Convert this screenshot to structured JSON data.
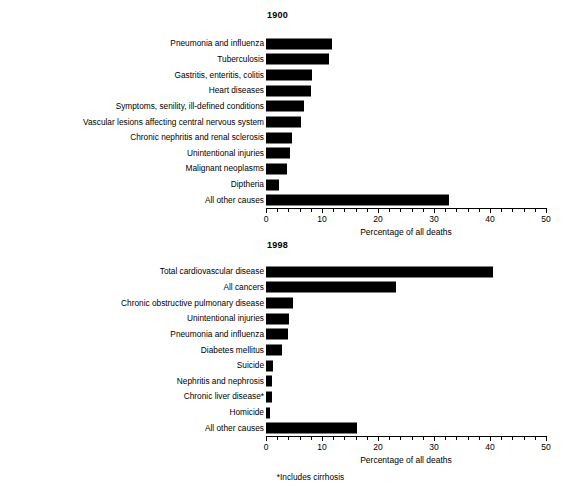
{
  "figure": {
    "footnote": "*Includes cirrhosis"
  },
  "chart_data": [
    {
      "type": "bar",
      "orientation": "horizontal",
      "title": "1900",
      "xlabel": "Percentage of all deaths",
      "ylabel": "",
      "xlim": [
        0,
        50
      ],
      "xticks": [
        0,
        10,
        20,
        30,
        40,
        50
      ],
      "xtick_labels": [
        "0",
        "10",
        "20",
        "30",
        "40",
        "50"
      ],
      "minor_tick_interval": 2,
      "grid": false,
      "legend": "none",
      "bar_color": "#000000",
      "categories": [
        "Pneumonia and influenza",
        "Tuberculosis",
        "Gastritis, enteritis, colitis",
        "Heart diseases",
        "Symptoms, senility, ill-defined conditions",
        "Vascular lesions affecting central nervous system",
        "Chronic nephritis and renal sclerosis",
        "Unintentional injuries",
        "Malignant neoplasms",
        "Diptheria",
        "All other causes"
      ],
      "values": [
        11.8,
        11.3,
        8.3,
        8.0,
        6.8,
        6.2,
        4.7,
        4.2,
        3.7,
        2.3,
        32.7
      ]
    },
    {
      "type": "bar",
      "orientation": "horizontal",
      "title": "1998",
      "xlabel": "Percentage of all deaths",
      "ylabel": "",
      "xlim": [
        0,
        50
      ],
      "xticks": [
        0,
        10,
        20,
        30,
        40,
        50
      ],
      "xtick_labels": [
        "0",
        "10",
        "20",
        "30",
        "40",
        "50"
      ],
      "minor_tick_interval": 2,
      "grid": false,
      "legend": "none",
      "bar_color": "#000000",
      "categories": [
        "Total cardiovascular disease",
        "All cancers",
        "Chronic obstructive pulmonary disease",
        "Unintentional injuries",
        "Pneumonia and influenza",
        "Diabetes mellitus",
        "Suicide",
        "Nephritis and nephrosis",
        "Chronic liver disease*",
        "Homicide",
        "All other causes"
      ],
      "values": [
        40.6,
        23.2,
        4.8,
        4.1,
        3.9,
        2.8,
        1.3,
        1.1,
        1.1,
        0.8,
        16.3
      ]
    }
  ]
}
